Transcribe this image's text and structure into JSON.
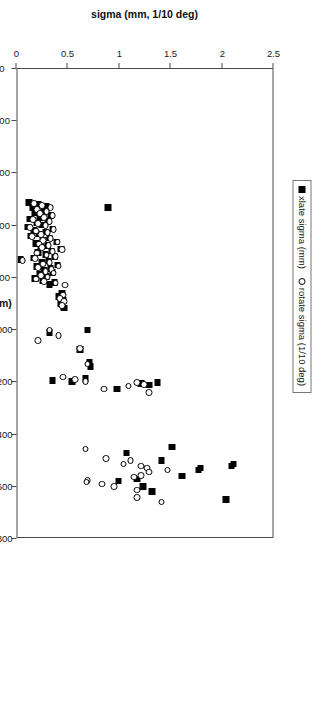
{
  "legend": {
    "position": "top-center",
    "entries": [
      {
        "key": "filled-square",
        "label": "xlate sigma  (mm)"
      },
      {
        "key": "open-circle",
        "label": "rotate sigma  (1/10 deg)"
      }
    ]
  },
  "axes": {
    "x": {
      "label": "IIVT_SII (mm)",
      "min": 0,
      "max": 1800,
      "ticks": [
        0,
        200,
        400,
        600,
        800,
        1000,
        1200,
        1400,
        1600,
        1800
      ],
      "ticklabels": [
        "0",
        "200",
        "400",
        "600",
        "800",
        "1000",
        "1200",
        "1400",
        "1600",
        "1800"
      ]
    },
    "y": {
      "label": "sigma (mm, 1/10 deg)",
      "min": 0,
      "max": 2.5,
      "ticks": [
        0,
        0.5,
        1,
        1.5,
        2,
        2.5
      ],
      "ticklabels": [
        "0",
        "0.5",
        "1",
        "1.5",
        "2",
        "2.5"
      ]
    }
  },
  "colors": {
    "marker_fill": "#000000",
    "marker_edge": "#000000",
    "frame": "#4a4a4a",
    "background": "#ffffff"
  },
  "chart_data": {
    "type": "scatter",
    "title": "",
    "xlabel": "IIVT_SII (mm)",
    "ylabel": "sigma (mm, 1/10 deg)",
    "xlim": [
      0,
      1800
    ],
    "ylim": [
      0,
      2.5
    ],
    "xticks": [
      0,
      200,
      400,
      600,
      800,
      1000,
      1200,
      1400,
      1600,
      1800
    ],
    "yticks": [
      0,
      0.5,
      1,
      1.5,
      2,
      2.5
    ],
    "grid": false,
    "legend_position": "top-center",
    "series": [
      {
        "name": "xlate sigma  (mm)",
        "marker": "filled-square",
        "points": [
          [
            530,
            0.9
          ],
          [
            512,
            0.13
          ],
          [
            518,
            0.22
          ],
          [
            525,
            0.3
          ],
          [
            530,
            0.17
          ],
          [
            545,
            0.28
          ],
          [
            552,
            0.19
          ],
          [
            560,
            0.34
          ],
          [
            568,
            0.24
          ],
          [
            575,
            0.14
          ],
          [
            583,
            0.31
          ],
          [
            590,
            0.21
          ],
          [
            598,
            0.26
          ],
          [
            605,
            0.12
          ],
          [
            612,
            0.36
          ],
          [
            618,
            0.18
          ],
          [
            625,
            0.29
          ],
          [
            632,
            0.23
          ],
          [
            640,
            0.15
          ],
          [
            648,
            0.33
          ],
          [
            655,
            0.27
          ],
          [
            662,
            0.4
          ],
          [
            668,
            0.2
          ],
          [
            675,
            0.31
          ],
          [
            682,
            0.25
          ],
          [
            690,
            0.44
          ],
          [
            697,
            0.35
          ],
          [
            703,
            0.22
          ],
          [
            710,
            0.29
          ],
          [
            718,
            0.38
          ],
          [
            724,
            0.18
          ],
          [
            730,
            0.05
          ],
          [
            736,
            0.32
          ],
          [
            742,
            0.26
          ],
          [
            750,
            0.41
          ],
          [
            757,
            0.21
          ],
          [
            765,
            0.34
          ],
          [
            772,
            0.28
          ],
          [
            780,
            0.36
          ],
          [
            788,
            0.24
          ],
          [
            795,
            0.3
          ],
          [
            802,
            0.19
          ],
          [
            810,
            0.27
          ],
          [
            818,
            0.38
          ],
          [
            826,
            0.33
          ],
          [
            860,
            0.45
          ],
          [
            872,
            0.42
          ],
          [
            886,
            0.46
          ],
          [
            900,
            0.44
          ],
          [
            916,
            0.47
          ],
          [
            1000,
            0.7
          ],
          [
            1010,
            0.33
          ],
          [
            1075,
            0.63
          ],
          [
            1125,
            0.72
          ],
          [
            1140,
            0.73
          ],
          [
            1185,
            0.68
          ],
          [
            1192,
            0.36
          ],
          [
            1196,
            0.55
          ],
          [
            1200,
            1.38
          ],
          [
            1205,
            1.22
          ],
          [
            1210,
            1.3
          ],
          [
            1225,
            0.99
          ],
          [
            1448,
            1.52
          ],
          [
            1470,
            1.08
          ],
          [
            1500,
            1.42
          ],
          [
            1512,
            2.12
          ],
          [
            1520,
            2.1
          ],
          [
            1528,
            1.8
          ],
          [
            1536,
            1.78
          ],
          [
            1558,
            1.62
          ],
          [
            1570,
            1.18
          ],
          [
            1578,
            1.0
          ],
          [
            1600,
            1.24
          ],
          [
            1618,
            1.33
          ],
          [
            1648,
            2.05
          ]
        ]
      },
      {
        "name": "rotate sigma  (1/10 deg)",
        "marker": "open-circle",
        "points": [
          [
            515,
            0.18
          ],
          [
            522,
            0.26
          ],
          [
            530,
            0.34
          ],
          [
            538,
            0.21
          ],
          [
            546,
            0.3
          ],
          [
            554,
            0.24
          ],
          [
            561,
            0.36
          ],
          [
            568,
            0.28
          ],
          [
            576,
            0.17
          ],
          [
            584,
            0.33
          ],
          [
            591,
            0.22
          ],
          [
            599,
            0.29
          ],
          [
            606,
            0.14
          ],
          [
            614,
            0.37
          ],
          [
            620,
            0.2
          ],
          [
            627,
            0.31
          ],
          [
            634,
            0.25
          ],
          [
            641,
            0.16
          ],
          [
            649,
            0.34
          ],
          [
            656,
            0.27
          ],
          [
            663,
            0.41
          ],
          [
            670,
            0.23
          ],
          [
            677,
            0.32
          ],
          [
            684,
            0.26
          ],
          [
            691,
            0.45
          ],
          [
            698,
            0.36
          ],
          [
            705,
            0.21
          ],
          [
            712,
            0.3
          ],
          [
            719,
            0.39
          ],
          [
            726,
            0.19
          ],
          [
            733,
            0.07
          ],
          [
            740,
            0.33
          ],
          [
            747,
            0.27
          ],
          [
            754,
            0.42
          ],
          [
            761,
            0.22
          ],
          [
            768,
            0.35
          ],
          [
            775,
            0.29
          ],
          [
            782,
            0.37
          ],
          [
            790,
            0.25
          ],
          [
            797,
            0.31
          ],
          [
            805,
            0.2
          ],
          [
            813,
            0.28
          ],
          [
            820,
            0.39
          ],
          [
            828,
            0.48
          ],
          [
            865,
            0.46
          ],
          [
            878,
            0.43
          ],
          [
            890,
            0.47
          ],
          [
            905,
            0.45
          ],
          [
            1000,
            0.33
          ],
          [
            1020,
            0.42
          ],
          [
            1040,
            0.22
          ],
          [
            1070,
            0.63
          ],
          [
            1130,
            0.7
          ],
          [
            1180,
            0.46
          ],
          [
            1190,
            0.58
          ],
          [
            1196,
            0.68
          ],
          [
            1200,
            1.18
          ],
          [
            1208,
            1.25
          ],
          [
            1214,
            1.1
          ],
          [
            1226,
            0.86
          ],
          [
            1240,
            1.3
          ],
          [
            1455,
            0.68
          ],
          [
            1492,
            0.88
          ],
          [
            1500,
            1.12
          ],
          [
            1512,
            1.05
          ],
          [
            1520,
            1.22
          ],
          [
            1528,
            1.28
          ],
          [
            1536,
            1.48
          ],
          [
            1544,
            1.3
          ],
          [
            1556,
            1.22
          ],
          [
            1562,
            1.15
          ],
          [
            1576,
            0.7
          ],
          [
            1582,
            0.69
          ],
          [
            1590,
            0.84
          ],
          [
            1600,
            0.96
          ],
          [
            1612,
            1.18
          ],
          [
            1640,
            1.18
          ],
          [
            1658,
            1.42
          ]
        ]
      }
    ]
  }
}
